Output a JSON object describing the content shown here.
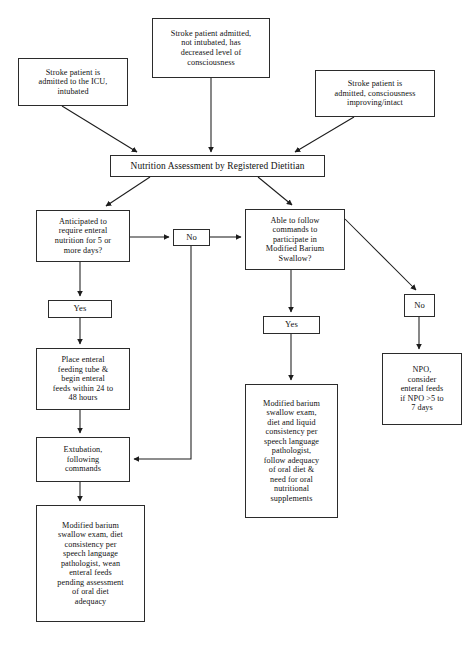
{
  "figure": {
    "kind": "clinical-algorithm-flowchart"
  },
  "nodes": [
    {
      "id": "icu-intubated",
      "label": "Stroke patient is\nadmitted to the ICU,\nintubated",
      "x": 18,
      "y": 58,
      "w": 110,
      "h": 48,
      "size": "n-small"
    },
    {
      "id": "decreased-loc",
      "label": "Stroke patient admitted,\nnot intubated, has\ndecreased level of\nconsciousness",
      "x": 152,
      "y": 18,
      "w": 118,
      "h": 60,
      "size": "n-small"
    },
    {
      "id": "consciousness-intact",
      "label": "Stroke patient is\nadmitted, consciousness\nimproving/intact",
      "x": 315,
      "y": 70,
      "w": 120,
      "h": 47,
      "size": "n-small"
    },
    {
      "id": "nutrition-assessment",
      "label": "Nutrition Assessment by Registered Dietitian",
      "x": 110,
      "y": 155,
      "w": 215,
      "h": 22,
      "size": "n-bar"
    },
    {
      "id": "anticipated-enteral",
      "label": "Anticipated to\nrequire enteral\nnutrition for 5 or\nmore days?",
      "x": 36,
      "y": 210,
      "w": 94,
      "h": 52,
      "size": "n-small"
    },
    {
      "id": "no-left",
      "label": "No",
      "x": 173,
      "y": 229,
      "w": 37,
      "h": 17,
      "size": "n-lbl"
    },
    {
      "id": "able-to-follow",
      "label": "Able to follow\ncommands to\nparticipate in\nModified Barium\nSwallow?",
      "x": 245,
      "y": 209,
      "w": 100,
      "h": 61,
      "size": "n-small"
    },
    {
      "id": "yes-left",
      "label": "Yes",
      "x": 48,
      "y": 300,
      "w": 64,
      "h": 18,
      "size": "n-lbl"
    },
    {
      "id": "yes-middle",
      "label": "Yes",
      "x": 263,
      "y": 316,
      "w": 57,
      "h": 18,
      "size": "n-lbl"
    },
    {
      "id": "no-right",
      "label": "No",
      "x": 404,
      "y": 294,
      "w": 31,
      "h": 23,
      "size": "n-lbl"
    },
    {
      "id": "place-enteral-tube",
      "label": "Place enteral\nfeeding tube &\nbegin enteral\nfeeds within 24 to\n48 hours",
      "x": 36,
      "y": 348,
      "w": 94,
      "h": 62,
      "size": "n-small"
    },
    {
      "id": "npo-consider",
      "label": "NPO,\nconsider\nenteral feeds\nif NPO >5 to\n7 days",
      "x": 382,
      "y": 353,
      "w": 80,
      "h": 72,
      "size": "n-small"
    },
    {
      "id": "mbs-oral-supplements",
      "label": "Modified barium\nswallow exam,\ndiet and liquid\nconsistency per\nspeech language\npathologist,\nfollow adequacy\nof oral diet &\nneed for oral\nnutritional\nsupplements",
      "x": 245,
      "y": 384,
      "w": 93,
      "h": 134,
      "size": "n-small"
    },
    {
      "id": "extubation",
      "label": "Extubation,\nfollowing\ncommands",
      "x": 36,
      "y": 437,
      "w": 94,
      "h": 45,
      "size": "n-small"
    },
    {
      "id": "mbs-wean-enteral",
      "label": "Modified barium\nswallow exam, diet\nconsistency per\nspeech language\npathologist, wean\nenteral feeds\npending assessment\nof oral diet\nadequacy",
      "x": 36,
      "y": 505,
      "w": 109,
      "h": 117,
      "size": "n-small"
    }
  ],
  "caption": {
    "text": ""
  }
}
